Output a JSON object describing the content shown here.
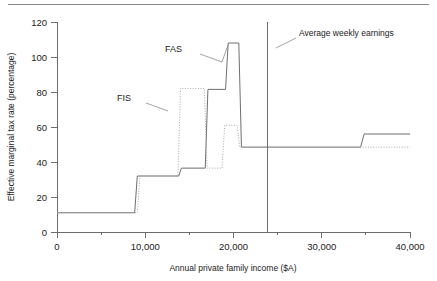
{
  "chart_data": {
    "type": "line",
    "title": "",
    "xlabel": "Annual private family income ($A)",
    "ylabel": "Effective marginal tax rate (percentage)",
    "xlim": [
      0,
      40000
    ],
    "ylim": [
      0,
      120
    ],
    "xticks": [
      0,
      10000,
      20000,
      30000,
      40000
    ],
    "xticklabels": [
      "0",
      "10,000",
      "20,000",
      "30,000",
      "40,000"
    ],
    "xminorticks": [
      5000,
      15000,
      25000,
      35000
    ],
    "yticks": [
      0,
      20,
      40,
      60,
      80,
      100,
      120
    ],
    "yticklabels": [
      "0",
      "20",
      "40",
      "60",
      "80",
      "100",
      "120"
    ],
    "grid": false,
    "legend_position": "inline-annotations",
    "series": [
      {
        "name": "FAS",
        "style": "solid",
        "color": "#6f6f6f",
        "label": "FAS",
        "points": [
          [
            0,
            11
          ],
          [
            8800,
            11
          ],
          [
            9100,
            32
          ],
          [
            13800,
            32
          ],
          [
            14100,
            36.5
          ],
          [
            16800,
            36.5
          ],
          [
            17100,
            81.5
          ],
          [
            19100,
            81.5
          ],
          [
            19400,
            108
          ],
          [
            20600,
            108
          ],
          [
            20900,
            48.5
          ],
          [
            34400,
            48.5
          ],
          [
            34800,
            56
          ],
          [
            40000,
            56
          ]
        ]
      },
      {
        "name": "FIS",
        "style": "dotted",
        "color": "#a9a9a9",
        "label": "FIS",
        "points": [
          [
            0,
            11
          ],
          [
            9100,
            11
          ],
          [
            9400,
            32
          ],
          [
            13700,
            32
          ],
          [
            14000,
            82
          ],
          [
            16700,
            82
          ],
          [
            17000,
            36.5
          ],
          [
            18700,
            36.5
          ],
          [
            19000,
            61
          ],
          [
            20400,
            61
          ],
          [
            20700,
            48.5
          ],
          [
            40000,
            48.5
          ]
        ]
      }
    ],
    "annotations": [
      {
        "name": "fas-label",
        "text": "FAS",
        "text_x": 182,
        "text_y": 52,
        "leader": [
          [
            200,
            54
          ],
          [
            222,
            62
          ],
          [
            228,
            45
          ]
        ]
      },
      {
        "name": "fis-label",
        "text": "FIS",
        "text_x": 131,
        "text_y": 101,
        "leader": [
          [
            146,
            103
          ],
          [
            168,
            111
          ]
        ]
      },
      {
        "name": "average-weekly-earnings-label",
        "text": "Average weekly earnings",
        "text_x": 299,
        "text_y": 36,
        "leader": [
          [
            296,
            38
          ],
          [
            276,
            48
          ]
        ]
      }
    ],
    "vertical_markers": [
      {
        "name": "average-weekly-earnings-line",
        "label": "Average weekly earnings",
        "x_value": 23900,
        "y_from": 0,
        "y_to": 120
      }
    ]
  }
}
